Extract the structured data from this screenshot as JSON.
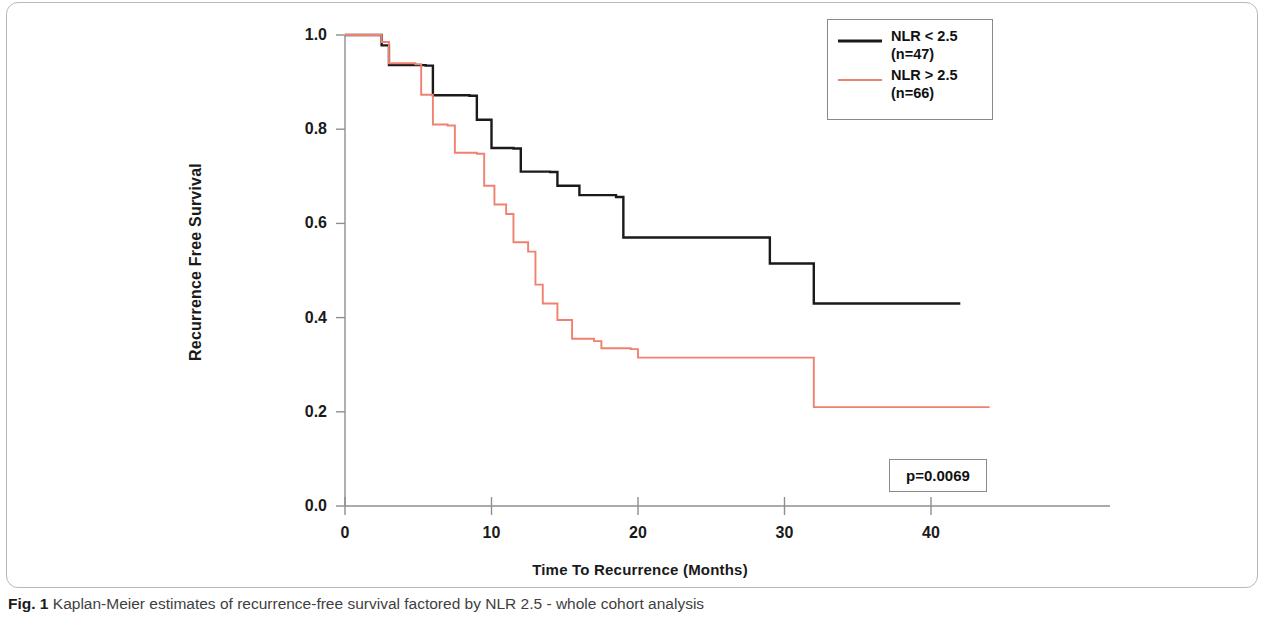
{
  "figure": {
    "caption_prefix": "Fig. 1",
    "caption_text": "Kaplan-Meier estimates of recurrence-free survival factored by NLR 2.5 - whole cohort analysis"
  },
  "axes": {
    "y_title": "Recurrence Free Survival",
    "x_title": "Time To Recurrence (Months)",
    "y_ticks": [
      "1.0",
      "0.8",
      "0.6",
      "0.4",
      "0.2",
      "0.0"
    ],
    "x_ticks": [
      "0",
      "10",
      "20",
      "30",
      "40"
    ]
  },
  "legend": {
    "entries": [
      {
        "label_line1": "NLR < 2.5",
        "label_line2": "(n=47)",
        "color": "#1a1a1a"
      },
      {
        "label_line1": "NLR > 2.5",
        "label_line2": "(n=66)",
        "color": "#F08070"
      }
    ]
  },
  "statistics": {
    "p_value_label": "p=0.0069"
  },
  "chart_data": {
    "type": "line",
    "subtype": "kaplan-meier-step",
    "title": "Kaplan-Meier estimates of recurrence-free survival factored by NLR 2.5 - whole cohort analysis",
    "xlabel": "Time To Recurrence (Months)",
    "ylabel": "Recurrence Free Survival",
    "xlim": [
      0,
      45.5
    ],
    "ylim": [
      0.0,
      1.0
    ],
    "xticks": [
      0,
      10,
      20,
      30,
      40
    ],
    "yticks": [
      0.0,
      0.2,
      0.4,
      0.6,
      0.8,
      1.0
    ],
    "grid": false,
    "legend_position": "top-right",
    "annotations": [
      {
        "text": "p=0.0069",
        "x": 37.0,
        "y": 0.09
      }
    ],
    "series": [
      {
        "name": "NLR < 2.5",
        "n": 47,
        "color": "#1a1a1a",
        "steps": [
          {
            "t": 0.0,
            "s": 1.0
          },
          {
            "t": 2.5,
            "s": 0.978
          },
          {
            "t": 3.0,
            "s": 0.936
          },
          {
            "t": 5.5,
            "s": 0.935
          },
          {
            "t": 6.0,
            "s": 0.872
          },
          {
            "t": 8.5,
            "s": 0.871
          },
          {
            "t": 9.0,
            "s": 0.82
          },
          {
            "t": 10.0,
            "s": 0.76
          },
          {
            "t": 11.5,
            "s": 0.759
          },
          {
            "t": 12.0,
            "s": 0.71
          },
          {
            "t": 14.0,
            "s": 0.709
          },
          {
            "t": 14.5,
            "s": 0.68
          },
          {
            "t": 16.0,
            "s": 0.66
          },
          {
            "t": 18.5,
            "s": 0.656
          },
          {
            "t": 19.0,
            "s": 0.57
          },
          {
            "t": 28.8,
            "s": 0.57
          },
          {
            "t": 29.0,
            "s": 0.515
          },
          {
            "t": 31.8,
            "s": 0.515
          },
          {
            "t": 32.0,
            "s": 0.43
          },
          {
            "t": 42.0,
            "s": 0.43
          }
        ]
      },
      {
        "name": "NLR > 2.5",
        "n": 66,
        "color": "#F08070",
        "steps": [
          {
            "t": 0.0,
            "s": 1.0
          },
          {
            "t": 2.5,
            "s": 0.985
          },
          {
            "t": 3.0,
            "s": 0.94
          },
          {
            "t": 4.8,
            "s": 0.938
          },
          {
            "t": 5.2,
            "s": 0.873
          },
          {
            "t": 6.0,
            "s": 0.81
          },
          {
            "t": 7.0,
            "s": 0.808
          },
          {
            "t": 7.5,
            "s": 0.75
          },
          {
            "t": 9.0,
            "s": 0.748
          },
          {
            "t": 9.5,
            "s": 0.68
          },
          {
            "t": 10.2,
            "s": 0.64
          },
          {
            "t": 11.0,
            "s": 0.62
          },
          {
            "t": 11.5,
            "s": 0.56
          },
          {
            "t": 12.5,
            "s": 0.54
          },
          {
            "t": 13.0,
            "s": 0.47
          },
          {
            "t": 13.5,
            "s": 0.43
          },
          {
            "t": 14.5,
            "s": 0.395
          },
          {
            "t": 15.5,
            "s": 0.355
          },
          {
            "t": 17.0,
            "s": 0.35
          },
          {
            "t": 17.5,
            "s": 0.335
          },
          {
            "t": 19.5,
            "s": 0.333
          },
          {
            "t": 20.0,
            "s": 0.315
          },
          {
            "t": 31.8,
            "s": 0.315
          },
          {
            "t": 32.0,
            "s": 0.21
          },
          {
            "t": 44.0,
            "s": 0.21
          }
        ]
      }
    ]
  }
}
